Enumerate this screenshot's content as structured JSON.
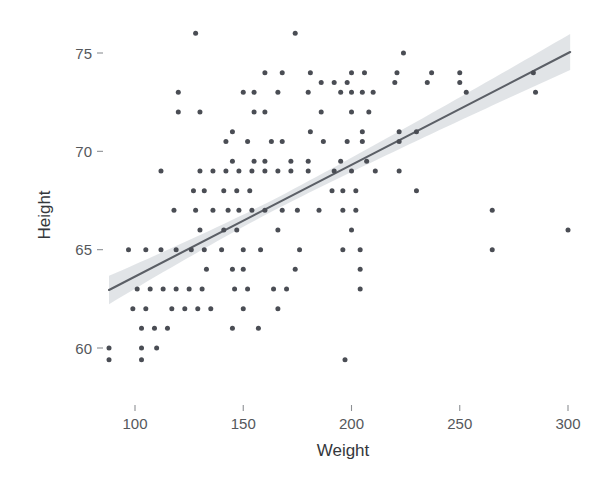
{
  "chart_data": {
    "type": "scatter",
    "title": "",
    "subtitle": "",
    "xlabel": "Weight",
    "ylabel": "Height",
    "xlim": [
      80,
      310
    ],
    "ylim": [
      58.4,
      76.6
    ],
    "xticks": [
      100,
      150,
      200,
      250,
      300
    ],
    "xtick_labels": [
      "100",
      "150",
      "200",
      "250",
      "300"
    ],
    "yticks": [
      60,
      65,
      70,
      75
    ],
    "ytick_labels": [
      "60",
      "70",
      "65",
      "75"
    ],
    "ytick_labels_ordered": [
      "75",
      "70",
      "65",
      "60"
    ],
    "grid": false,
    "legend": "none",
    "background": "#ffffff",
    "point_color": "#4a4d54",
    "point_size": 5,
    "line_color": "#5b5f66",
    "band_color": "#d5dade",
    "series": [
      {
        "name": "observations",
        "marker": "circle",
        "points": [
          [
            128,
            76
          ],
          [
            174,
            76
          ],
          [
            224,
            75
          ],
          [
            160,
            74
          ],
          [
            168,
            74
          ],
          [
            181,
            74
          ],
          [
            200,
            74
          ],
          [
            206,
            74
          ],
          [
            221,
            74
          ],
          [
            237,
            74
          ],
          [
            250,
            74
          ],
          [
            284,
            74
          ],
          [
            186,
            73.5
          ],
          [
            192,
            73.5
          ],
          [
            198,
            73.5
          ],
          [
            220,
            73.5
          ],
          [
            235,
            73.5
          ],
          [
            250,
            73.5
          ],
          [
            120,
            73
          ],
          [
            150,
            73
          ],
          [
            155,
            73
          ],
          [
            166,
            73
          ],
          [
            180,
            73
          ],
          [
            195,
            73
          ],
          [
            200,
            73
          ],
          [
            205,
            73
          ],
          [
            210,
            73
          ],
          [
            253,
            73
          ],
          [
            285,
            73
          ],
          [
            120,
            72
          ],
          [
            130,
            72
          ],
          [
            155,
            72
          ],
          [
            160,
            72
          ],
          [
            186,
            72
          ],
          [
            200,
            72
          ],
          [
            208,
            72
          ],
          [
            145,
            71
          ],
          [
            181,
            71
          ],
          [
            205,
            71
          ],
          [
            222,
            71
          ],
          [
            230,
            71
          ],
          [
            142,
            70.5
          ],
          [
            152,
            70.5
          ],
          [
            163,
            70.5
          ],
          [
            168,
            70.5
          ],
          [
            187,
            70.5
          ],
          [
            198,
            70.5
          ],
          [
            205,
            70.5
          ],
          [
            222,
            70.5
          ],
          [
            145,
            69.5
          ],
          [
            155,
            69.5
          ],
          [
            160,
            69.5
          ],
          [
            172,
            69.5
          ],
          [
            180,
            69.5
          ],
          [
            195,
            69.5
          ],
          [
            207,
            69.5
          ],
          [
            112,
            69
          ],
          [
            130,
            69
          ],
          [
            136,
            69
          ],
          [
            142,
            69
          ],
          [
            148,
            69
          ],
          [
            154,
            69
          ],
          [
            160,
            69
          ],
          [
            166,
            69
          ],
          [
            172,
            69
          ],
          [
            180,
            69
          ],
          [
            192,
            69
          ],
          [
            200,
            69
          ],
          [
            211,
            69
          ],
          [
            222,
            69
          ],
          [
            127,
            68
          ],
          [
            132,
            68
          ],
          [
            141,
            68
          ],
          [
            147,
            68
          ],
          [
            153,
            68
          ],
          [
            191,
            68
          ],
          [
            196,
            68
          ],
          [
            202,
            68
          ],
          [
            230,
            68
          ],
          [
            118,
            67
          ],
          [
            128,
            67
          ],
          [
            136,
            67
          ],
          [
            143,
            67
          ],
          [
            148,
            67
          ],
          [
            154,
            67
          ],
          [
            160,
            67
          ],
          [
            168,
            67
          ],
          [
            175,
            67
          ],
          [
            185,
            67
          ],
          [
            196,
            67
          ],
          [
            202,
            67
          ],
          [
            265,
            67
          ],
          [
            130,
            66
          ],
          [
            141,
            66
          ],
          [
            147,
            66
          ],
          [
            166,
            66
          ],
          [
            200,
            66
          ],
          [
            300,
            66
          ],
          [
            97,
            65
          ],
          [
            105,
            65
          ],
          [
            112,
            65
          ],
          [
            119,
            65
          ],
          [
            126,
            65
          ],
          [
            132,
            65
          ],
          [
            140,
            65
          ],
          [
            150,
            65
          ],
          [
            158,
            65
          ],
          [
            176,
            65
          ],
          [
            196,
            65
          ],
          [
            204,
            65
          ],
          [
            265,
            65
          ],
          [
            133,
            64
          ],
          [
            145,
            64
          ],
          [
            150,
            64
          ],
          [
            174,
            64
          ],
          [
            204,
            64
          ],
          [
            101,
            63
          ],
          [
            107,
            63
          ],
          [
            113,
            63
          ],
          [
            119,
            63
          ],
          [
            125,
            63
          ],
          [
            131,
            63
          ],
          [
            146,
            63
          ],
          [
            152,
            63
          ],
          [
            164,
            63
          ],
          [
            170,
            63
          ],
          [
            204,
            63
          ],
          [
            99,
            62
          ],
          [
            105,
            62
          ],
          [
            117,
            62
          ],
          [
            123,
            62
          ],
          [
            129,
            62
          ],
          [
            135,
            62
          ],
          [
            150,
            62
          ],
          [
            166,
            62
          ],
          [
            103,
            61
          ],
          [
            109,
            61
          ],
          [
            115,
            61
          ],
          [
            145,
            61
          ],
          [
            157,
            61
          ],
          [
            88,
            60
          ],
          [
            103,
            60
          ],
          [
            110,
            60
          ],
          [
            88,
            59.4
          ],
          [
            103,
            59.4
          ],
          [
            197,
            59.4
          ]
        ]
      }
    ],
    "fit": {
      "name": "linear regression",
      "type": "lm",
      "x_start": 88,
      "x_end": 301,
      "y_start": 62.95,
      "y_end": 75.05,
      "band_half_width_min": 0.28,
      "band_half_width_left": 0.72,
      "band_half_width_right": 0.92,
      "band_center_x": 163
    }
  },
  "axes": {
    "x": {
      "title": "Weight",
      "ticks": [
        "100",
        "150",
        "200",
        "250",
        "300"
      ]
    },
    "y": {
      "title": "Height",
      "ticks": [
        "75",
        "70",
        "65",
        "60"
      ]
    }
  }
}
